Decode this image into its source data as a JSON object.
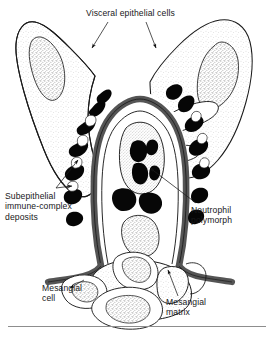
{
  "figure": {
    "name": "glomerular-capillary-loop-diagram",
    "style": "line drawing, black ink with stipple shading"
  },
  "labels": {
    "visceral_epithelial_cells": "Visceral epithelial cells",
    "subepithelial_deposits_line1": "Subepithelial",
    "subepithelial_deposits_line2": "immune-complex",
    "subepithelial_deposits_line3": "deposits",
    "neutrophil_line1": "Neutrophil",
    "neutrophil_line2": "polymorph",
    "mesangial_cell_line1": "Mesangial",
    "mesangial_cell_line2": "cell",
    "mesangial_matrix_line1": "Mesangial",
    "mesangial_matrix_line2": "matrix"
  },
  "colors": {
    "ink": "#161616",
    "basement_membrane": "#555555",
    "deposit_fill": "#000000",
    "stipple": "#9a9a9a",
    "cytoplasm": "#fbfbfb",
    "rule": "#8d8d8d",
    "background": "#ffffff"
  },
  "structures": {
    "visceral_epithelial_cells": 2,
    "subepithelial_deposits": 14,
    "neutrophil_polymorphs": 1,
    "neutrophil_nuclear_lobes": 4,
    "mesangial_cells": 3,
    "leader_arrows": 6
  }
}
